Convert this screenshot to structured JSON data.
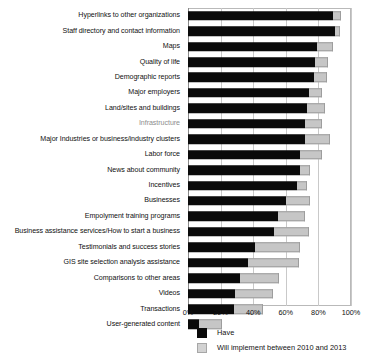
{
  "chart_data": {
    "type": "bar",
    "orientation": "horizontal",
    "stacked": true,
    "title": "",
    "xlabel": "",
    "ylabel": "",
    "xlim": [
      0,
      100
    ],
    "xticks": [
      "0%",
      "20%",
      "40%",
      "60%",
      "80%",
      "100%"
    ],
    "xtick_values": [
      0,
      20,
      40,
      60,
      80,
      100
    ],
    "grid": true,
    "legend_position": "bottom",
    "series": [
      {
        "name": "Have",
        "color": "#0a0a0a"
      },
      {
        "name": "Will implement between 2010 and 2013",
        "color": "#c6c6c6"
      }
    ],
    "categories": [
      "Hyperlinks to other organizations",
      "Staff directory and contact information",
      "Maps",
      "Quality of life",
      "Demographic reports",
      "Major employers",
      "Land/sites and buildings",
      "Infrastructure",
      "Major Industries or business/industry clusters",
      "Labor force",
      "News about community",
      "Incentives",
      "Businesses",
      "Empolyment training programs",
      "Business assistance services/How to start a business",
      "Testimonials and success stories",
      "GIS site selection analysis assistance",
      "Comparisons to other areas",
      "Videos",
      "Transactions",
      "User-generated content"
    ],
    "values": {
      "Have": [
        89,
        90,
        79,
        78,
        77,
        74,
        73,
        72,
        72,
        69,
        69,
        67,
        60,
        55,
        53,
        41,
        37,
        32,
        29,
        28,
        7
      ],
      "Will implement between 2010 and 2013": [
        5,
        3,
        10,
        8,
        8,
        8,
        11,
        10,
        15,
        13,
        6,
        6,
        15,
        17,
        21,
        28,
        31,
        24,
        23,
        18,
        14
      ]
    },
    "rows": [
      {
        "label": "Hyperlinks to other organizations",
        "have": 89,
        "will": 5,
        "faded": false
      },
      {
        "label": "Staff directory and contact information",
        "have": 90,
        "will": 3,
        "faded": false
      },
      {
        "label": "Maps",
        "have": 79,
        "will": 10,
        "faded": false
      },
      {
        "label": "Quality of life",
        "have": 78,
        "will": 8,
        "faded": false
      },
      {
        "label": "Demographic reports",
        "have": 77,
        "will": 8,
        "faded": false
      },
      {
        "label": "Major employers",
        "have": 74,
        "will": 8,
        "faded": false
      },
      {
        "label": "Land/sites and buildings",
        "have": 73,
        "will": 11,
        "faded": false
      },
      {
        "label": "Infrastructure",
        "have": 72,
        "will": 10,
        "faded": true
      },
      {
        "label": "Major Industries or business/industry clusters",
        "have": 72,
        "will": 15,
        "faded": false
      },
      {
        "label": "Labor force",
        "have": 69,
        "will": 13,
        "faded": false
      },
      {
        "label": "News about community",
        "have": 69,
        "will": 6,
        "faded": false
      },
      {
        "label": "Incentives",
        "have": 67,
        "will": 6,
        "faded": false
      },
      {
        "label": "Businesses",
        "have": 60,
        "will": 15,
        "faded": false
      },
      {
        "label": "Empolyment training programs",
        "have": 55,
        "will": 17,
        "faded": false
      },
      {
        "label": "Business assistance services/How to start a business",
        "have": 53,
        "will": 21,
        "faded": false
      },
      {
        "label": "Testimonials and success stories",
        "have": 41,
        "will": 28,
        "faded": false
      },
      {
        "label": "GIS site selection analysis assistance",
        "have": 37,
        "will": 31,
        "faded": false
      },
      {
        "label": "Comparisons to other areas",
        "have": 32,
        "will": 24,
        "faded": false
      },
      {
        "label": "Videos",
        "have": 29,
        "will": 23,
        "faded": false
      },
      {
        "label": "Transactions",
        "have": 28,
        "will": 18,
        "faded": false
      },
      {
        "label": "User-generated content",
        "have": 7,
        "will": 14,
        "faded": false
      }
    ]
  },
  "legend": {
    "items": [
      {
        "label": "Have",
        "swatch": "have"
      },
      {
        "label": "Will implement between 2010 and 2013",
        "swatch": "will"
      }
    ]
  }
}
